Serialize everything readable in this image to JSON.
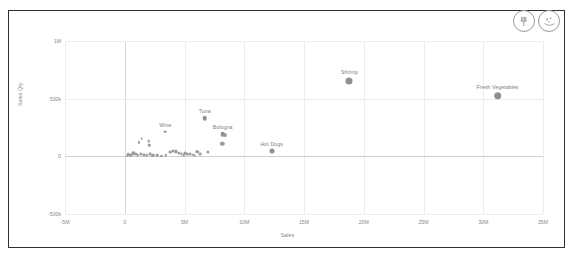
{
  "toolbar": {
    "buttons": [
      {
        "name": "utensils-icon",
        "title": "Utensils"
      },
      {
        "name": "scatter-dots-icon",
        "title": "Scatter"
      }
    ]
  },
  "chart_data": {
    "type": "scatter",
    "title": "",
    "xlabel": "Sales",
    "ylabel": "Sales Qty",
    "xlim": [
      -5000000,
      35000000
    ],
    "ylim": [
      -500000,
      1000000
    ],
    "grid": true,
    "legend": "none",
    "xticks": [
      "-5M",
      "0",
      "5M",
      "10M",
      "15M",
      "20M",
      "25M",
      "30M",
      "35M"
    ],
    "xtick_values": [
      -5000000,
      0,
      5000000,
      10000000,
      15000000,
      20000000,
      25000000,
      30000000,
      35000000
    ],
    "yticks": [
      "1M",
      "500k",
      "0",
      "-500k"
    ],
    "ytick_values": [
      1000000,
      500000,
      0,
      -500000
    ],
    "labeled_points": [
      {
        "label": "Shrimp",
        "x": 18800000,
        "y": 655000,
        "size": 7.0
      },
      {
        "label": "Fresh Vegetables",
        "x": 31200000,
        "y": 525000,
        "size": 7.6
      },
      {
        "label": "Tuna",
        "x": 6700000,
        "y": 330000,
        "size": 4.6
      },
      {
        "label": "Bologna",
        "x": 8200000,
        "y": 190000,
        "size": 4.6
      },
      {
        "label": "Hot Dogs",
        "x": 12300000,
        "y": 45000,
        "size": 5.0
      },
      {
        "label": "Wine",
        "x": 3400000,
        "y": 215000,
        "size": 2.6
      }
    ],
    "points": [
      {
        "x": 8350000,
        "y": 185000,
        "size": 4.2
      },
      {
        "x": 8150000,
        "y": 110000,
        "size": 4.4
      },
      {
        "x": 1450000,
        "y": 150000,
        "size": 2.4
      },
      {
        "x": 1200000,
        "y": 120000,
        "size": 2.2
      },
      {
        "x": 2000000,
        "y": 130000,
        "size": 2.6
      },
      {
        "x": 2050000,
        "y": 95000,
        "size": 2.4
      },
      {
        "x": 300000,
        "y": 20000,
        "size": 2.6
      },
      {
        "x": 500000,
        "y": 15000,
        "size": 3.0
      },
      {
        "x": 700000,
        "y": 25000,
        "size": 3.4
      },
      {
        "x": 900000,
        "y": 18000,
        "size": 3.0
      },
      {
        "x": 1100000,
        "y": 12000,
        "size": 2.6
      },
      {
        "x": 1350000,
        "y": 22000,
        "size": 3.2
      },
      {
        "x": 1600000,
        "y": 14000,
        "size": 2.8
      },
      {
        "x": 1850000,
        "y": 10000,
        "size": 2.4
      },
      {
        "x": 2150000,
        "y": 16000,
        "size": 2.8
      },
      {
        "x": 2400000,
        "y": 8000,
        "size": 2.4
      },
      {
        "x": 2700000,
        "y": 12000,
        "size": 2.6
      },
      {
        "x": 3050000,
        "y": 6000,
        "size": 2.2
      },
      {
        "x": 3450000,
        "y": 10000,
        "size": 2.4
      },
      {
        "x": 3800000,
        "y": 35000,
        "size": 2.8
      },
      {
        "x": 4050000,
        "y": 45000,
        "size": 3.0
      },
      {
        "x": 4300000,
        "y": 42000,
        "size": 3.2
      },
      {
        "x": 4500000,
        "y": 30000,
        "size": 3.0
      },
      {
        "x": 4750000,
        "y": 20000,
        "size": 2.8
      },
      {
        "x": 5000000,
        "y": 25000,
        "size": 3.0
      },
      {
        "x": 5250000,
        "y": 18000,
        "size": 2.8
      },
      {
        "x": 5500000,
        "y": 22000,
        "size": 3.0
      },
      {
        "x": 5750000,
        "y": 15000,
        "size": 2.6
      },
      {
        "x": 6050000,
        "y": 40000,
        "size": 3.6
      },
      {
        "x": 6300000,
        "y": 20000,
        "size": 2.8
      },
      {
        "x": 6950000,
        "y": 35000,
        "size": 3.2
      },
      {
        "x": 3150000,
        "y": 5000,
        "size": 2.0
      },
      {
        "x": 2250000,
        "y": 4000,
        "size": 2.0
      },
      {
        "x": 400000,
        "y": 8000,
        "size": 2.2
      },
      {
        "x": 150000,
        "y": 5000,
        "size": 2.0
      },
      {
        "x": 4950000,
        "y": 8000,
        "size": 2.4
      },
      {
        "x": 5900000,
        "y": 6000,
        "size": 2.2
      }
    ]
  }
}
